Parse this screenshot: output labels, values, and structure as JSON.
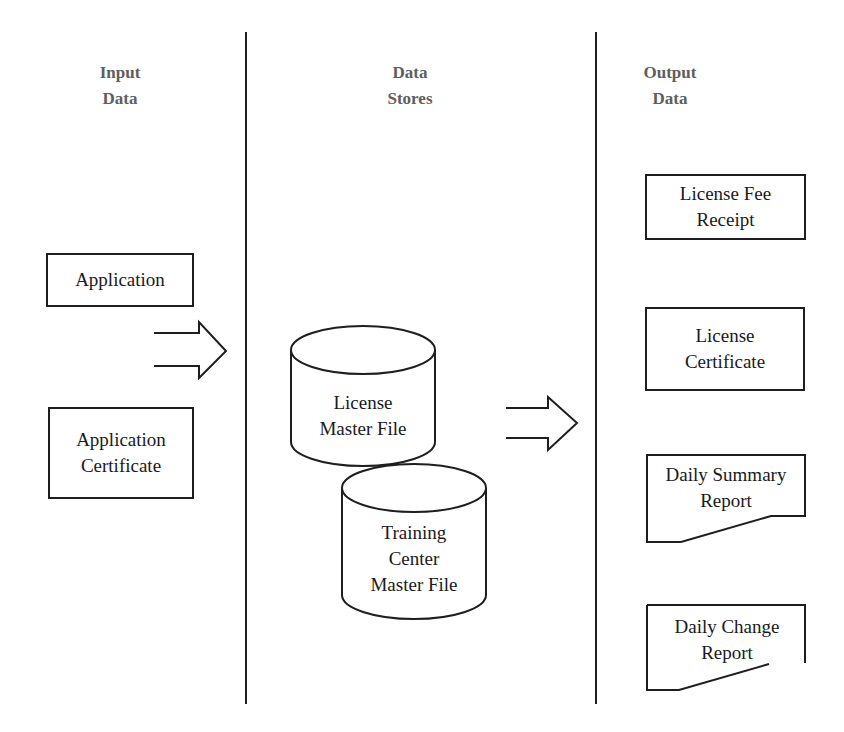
{
  "columns": {
    "input": {
      "header_line1": "Input",
      "header_line2": "Data"
    },
    "stores": {
      "header_line1": "Data",
      "header_line2": "Stores"
    },
    "output": {
      "header_line1": "Output",
      "header_line2": "Data"
    }
  },
  "inputs": [
    {
      "shape": "rectangle",
      "line1": "Application",
      "line2": ""
    },
    {
      "shape": "rectangle",
      "line1": "Training",
      "line2": "Certificate"
    }
  ],
  "stores": [
    {
      "shape": "cylinder",
      "line1": "License",
      "line2": "Master File",
      "line3": ""
    },
    {
      "shape": "cylinder",
      "line1": "Training",
      "line2": "Center",
      "line3": "Master File"
    }
  ],
  "outputs": [
    {
      "shape": "rectangle",
      "line1": "License Fee",
      "line2": "Receipt"
    },
    {
      "shape": "rectangle",
      "line1": "License",
      "line2": "Certificate"
    },
    {
      "shape": "document",
      "line1": "Daily Summary",
      "line2": "Report"
    },
    {
      "shape": "document",
      "line1": "Daily Change",
      "line2": "Report"
    }
  ],
  "flows": [
    {
      "from": "inputs",
      "to": "stores",
      "style": "hollow-arrow"
    },
    {
      "from": "stores",
      "to": "outputs",
      "style": "hollow-arrow"
    }
  ],
  "colors": {
    "stroke": "#1e1e1e",
    "header_text": "#5e5e5e",
    "body_text": "#1a1a1a"
  }
}
